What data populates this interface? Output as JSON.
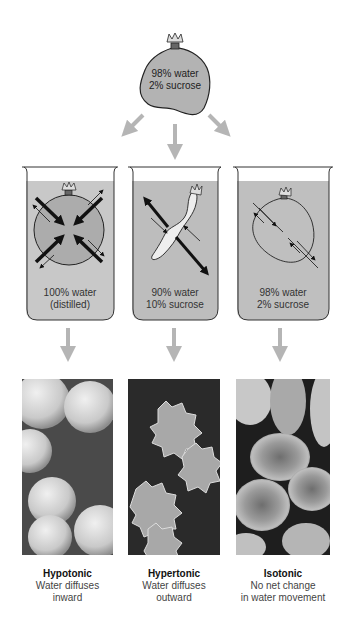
{
  "source_bag": {
    "line1": "98% water",
    "line2": "2% sucrose",
    "fill_color": "#b3b3b3"
  },
  "beakers": [
    {
      "line1": "100% water",
      "line2": "(distilled)",
      "solution_color": "#c8c8c8",
      "bag_state": "swollen",
      "arrows": "large inward, small outward"
    },
    {
      "line1": "90% water",
      "line2": "10% sucrose",
      "solution_color": "#bdbdbd",
      "bag_state": "shrunken",
      "arrows": "large outward, small inward"
    },
    {
      "line1": "98% water",
      "line2": "2% sucrose",
      "solution_color": "#bfbfbf",
      "bag_state": "unchanged",
      "arrows": "equal both ways"
    }
  ],
  "results": [
    {
      "title": "Hypotonic",
      "line1": "Water diffuses",
      "line2": "inward"
    },
    {
      "title": "Hypertonic",
      "line1": "Water diffuses",
      "line2": "outward"
    },
    {
      "title": "Isotonic",
      "line1": "No net change",
      "line2": "in water movement"
    }
  ],
  "colors": {
    "arrow_gray": "#b5b5b5",
    "outline": "#222222"
  }
}
